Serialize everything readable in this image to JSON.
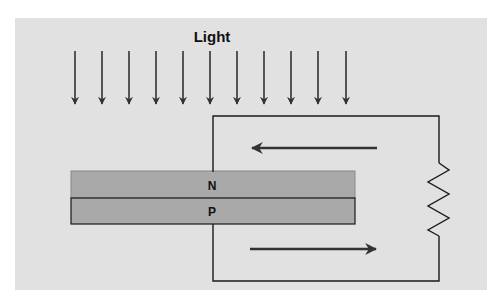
{
  "diagram": {
    "title_label": "Light",
    "layers": [
      {
        "id": "n",
        "label": "N"
      },
      {
        "id": "p",
        "label": "P"
      }
    ],
    "light_arrow_count": 11,
    "current_arrows": [
      {
        "position": "top",
        "direction": "left"
      },
      {
        "position": "bottom",
        "direction": "right"
      }
    ],
    "components": [
      "light-rays",
      "pn-junction",
      "circuit-wire",
      "resistor",
      "current-arrows"
    ],
    "colors": {
      "background": "#e1e1e1",
      "layer_fill": "#a9a9a9",
      "stroke": "#1a1a1a",
      "arrow": "#3a3a3a"
    }
  }
}
